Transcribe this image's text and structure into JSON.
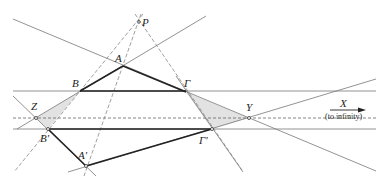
{
  "diagram": {
    "points": {
      "P": {
        "label": "P",
        "x": 139,
        "y": 22
      },
      "A": {
        "label": "A",
        "x": 123,
        "y": 66
      },
      "B": {
        "label": "B",
        "x": 80,
        "y": 91
      },
      "G": {
        "label": "Γ",
        "x": 186,
        "y": 92
      },
      "A1": {
        "label": "A′",
        "x": 86,
        "y": 166
      },
      "B1": {
        "label": "B′",
        "x": 48,
        "y": 129
      },
      "G1": {
        "label": "Γ′",
        "x": 212,
        "y": 129
      },
      "Z": {
        "label": "Z",
        "x": 36,
        "y": 118
      },
      "Y": {
        "label": "Y",
        "x": 249,
        "y": 118
      }
    },
    "labels": {
      "P": "P",
      "A": "A",
      "B": "B",
      "G": "Γ",
      "A1": "A′",
      "B1": "B′",
      "G1": "Γ′",
      "Z": "Z",
      "Y": "Y",
      "X": "X",
      "X_note": "(to infinity)"
    },
    "colors": {
      "thick_line": "#222222",
      "thin_line": "#777777",
      "dashed_line": "#888888",
      "shading": "#e2e2e2"
    }
  }
}
